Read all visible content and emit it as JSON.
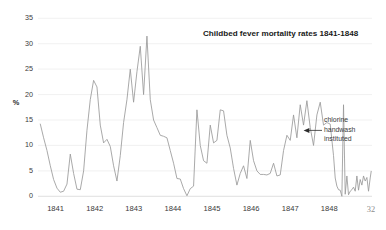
{
  "page": {
    "page_number": "32",
    "background_color": "#ffffff"
  },
  "chart_data": {
    "type": "line",
    "title": "Childbed fever mortality rates 1841-1848",
    "xlabel": "",
    "ylabel": "%",
    "ylim": [
      0,
      35
    ],
    "xlim": [
      1840.58,
      1848.92
    ],
    "yticks": [
      0,
      5,
      10,
      15,
      20,
      25,
      30,
      35
    ],
    "ytick_labels": [
      "0",
      "5",
      "10",
      "15",
      "20",
      "25",
      "30",
      "35"
    ],
    "xticks": [
      1841,
      1842,
      1843,
      1844,
      1845,
      1846,
      1847,
      1848
    ],
    "xtick_labels": [
      "1841",
      "1842",
      "1843",
      "1844",
      "1845",
      "1846",
      "1847",
      "1848"
    ],
    "grid": true,
    "grid_axis": "y",
    "legend": false,
    "line_color": "#9a9a9a",
    "series": [
      {
        "name": "Monthly childbed fever mortality (%)",
        "x": [
          1840.625,
          1840.708,
          1840.792,
          1840.875,
          1840.958,
          1841.042,
          1841.125,
          1841.208,
          1841.292,
          1841.375,
          1841.458,
          1841.542,
          1841.625,
          1841.708,
          1841.792,
          1841.875,
          1841.958,
          1842.042,
          1842.125,
          1842.208,
          1842.292,
          1842.375,
          1842.458,
          1842.542,
          1842.625,
          1842.708,
          1842.792,
          1842.875,
          1842.958,
          1843.042,
          1843.125,
          1843.208,
          1843.292,
          1843.375,
          1843.458,
          1843.542,
          1843.625,
          1843.708,
          1843.792,
          1843.875,
          1843.958,
          1844.042,
          1844.125,
          1844.208,
          1844.292,
          1844.375,
          1844.458,
          1844.542,
          1844.625,
          1844.708,
          1844.792,
          1844.875,
          1844.958,
          1845.042,
          1845.125,
          1845.208,
          1845.292,
          1845.375,
          1845.458,
          1845.542,
          1845.625,
          1845.708,
          1845.792,
          1845.875,
          1845.958,
          1846.042,
          1846.125,
          1846.208,
          1846.292,
          1846.375,
          1846.458,
          1846.542,
          1846.625,
          1846.708,
          1846.792,
          1846.875,
          1846.958,
          1847.042,
          1847.125,
          1847.208,
          1847.292,
          1847.375,
          1847.458,
          1847.542,
          1847.625,
          1847.708,
          1847.792,
          1847.875,
          1847.958,
          1848.042,
          1848.125,
          1848.208,
          1848.292,
          1848.375,
          1848.458,
          1848.542,
          1848.625,
          1848.708,
          1848.792,
          1848.875
        ],
        "values": [
          14.2,
          11.5,
          9.0,
          6.0,
          3.3,
          1.6,
          0.8,
          1.0,
          2.4,
          8.3,
          4.5,
          1.4,
          1.3,
          5.0,
          13.0,
          19.0,
          22.8,
          21.5,
          14.0,
          10.5,
          11.2,
          9.8,
          6.0,
          3.0,
          8.0,
          14.5,
          19.0,
          25.0,
          18.5,
          24.5,
          29.5,
          20.0,
          31.5,
          19.0,
          15.0,
          13.5,
          12.0,
          11.8,
          11.5,
          9.0,
          6.5,
          3.5,
          3.4,
          1.5,
          0.1,
          1.5,
          2.0,
          17.0,
          10.0,
          7.0,
          6.5,
          14.0,
          10.5,
          11.0,
          17.0,
          16.8,
          12.0,
          9.5,
          5.5,
          2.2,
          4.5,
          6.0,
          3.5,
          11.0,
          7.0,
          5.0,
          4.3,
          4.3,
          4.2,
          4.5,
          6.5,
          4.0,
          4.2,
          9.0,
          12.0,
          11.0,
          16.0,
          11.5,
          18.0,
          14.0,
          18.8,
          13.5,
          10.0,
          16.0,
          18.5,
          14.0,
          14.5,
          14.2,
          8.0,
          2.0,
          1.2,
          18.0,
          4.0,
          1.0,
          1.8,
          4.0,
          3.3,
          4.0,
          3.7,
          3.6
        ]
      },
      {
        "name": "Post-handwash tail (%)",
        "x": [
          1848.0,
          1848.083,
          1848.167,
          1848.25,
          1848.333,
          1848.417,
          1848.5,
          1848.583,
          1848.667,
          1848.75,
          1848.833,
          1848.9
        ],
        "values": [
          3.6,
          1.3,
          0.0,
          0.4,
          0.3,
          1.3,
          1.0,
          1.2,
          2.2,
          3.0,
          1.0,
          4.9
        ]
      }
    ],
    "annotations": [
      {
        "name": "chlorine-handwash-annotation",
        "text_lines": [
          "chlorine",
          "handwash",
          "instituted"
        ],
        "target_x": 1846.92,
        "target_y": 13.0,
        "arrow": true
      }
    ]
  }
}
